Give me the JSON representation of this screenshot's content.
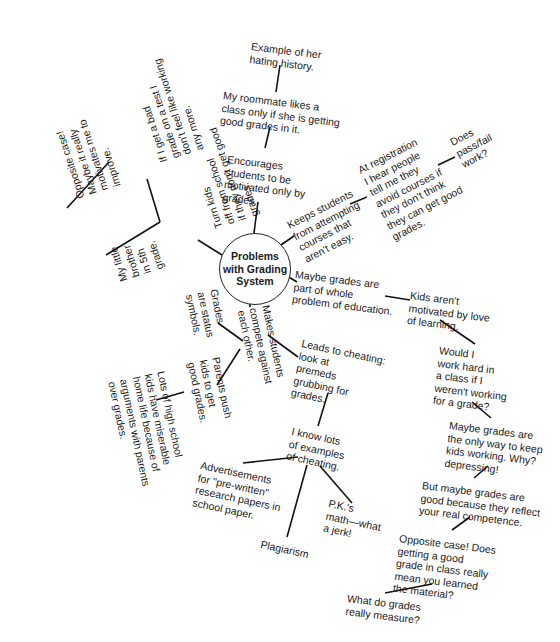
{
  "diagram": {
    "type": "mind-map",
    "center": {
      "label": "Problems\nwith Grading\nSystem"
    },
    "nodes": {
      "example_hating_history": "Example of her\nhating history.",
      "roommate": "My roommate likes a\nclass only if she is getting\ngood grades in it.",
      "encourages": "Encourages\nstudents to be\nmotivated only by\ngrades.",
      "keeps_students": "Keeps students\nfrom attempting\ncourses that\naren't easy.",
      "at_registration": "At registration\nI hear people\ntell me they\navoid courses if\nthey don't think\nthey can get good\ngrades.",
      "pass_fail": "Does\npass/fail\nwork?",
      "maybe_part": "Maybe grades are\npart of whole\nproblem of education.",
      "kids_arent": "Kids aren't\nmotivated by love\nof learning.",
      "would_i": "Would I\nwork hard in\na class if I\nweren't working\nfor a grade?",
      "only_way": "Maybe grades are\nthe only way to keep\nkids working. Why?\ndepressing!",
      "but_maybe": "But maybe grades are\ngood because they reflect\nyour real competence.",
      "opposite_does": "Opposite case! Does\ngetting a good\ngrade in class really\nmean you learned\nthe material?",
      "what_measure": "What do grades\nreally measure?",
      "leads_cheating": "Leads to cheating:\nlook at\npremeds\ngrubbing for\ngrades.",
      "i_know": "I know lots\nof examples\nof cheating.",
      "advertisements": "Advertisements\nfor \"pre-written\"\nresearch papers in\nschool paper.",
      "plagiarism": "Plagiarism",
      "pk_math": "P.K.'s\nmath—what\na jerk!",
      "makes_compete": "Makes students\ncompete against\neach other.",
      "status_symbols": "Grades\nare status\nsymbols.",
      "parents_push": "Parents push\nkids to get\ngood grades.",
      "lots_hs": "Lots of high school\nkids have miserable\nhome life because of\narguments with parents\nover grades.",
      "turn_off": "Turn kids\noff from school\nif they don't get good\ngrades.",
      "if_i_get_bad": "If I get a bad\ngrade on a test I\ndon't feel like working\nany more.",
      "opposite_maybe": "Opposite case!\nMaybe it really\nmotivates me to\nimprove.",
      "little_brother": "My little\nbrother\nin 5th\ngrade."
    }
  }
}
